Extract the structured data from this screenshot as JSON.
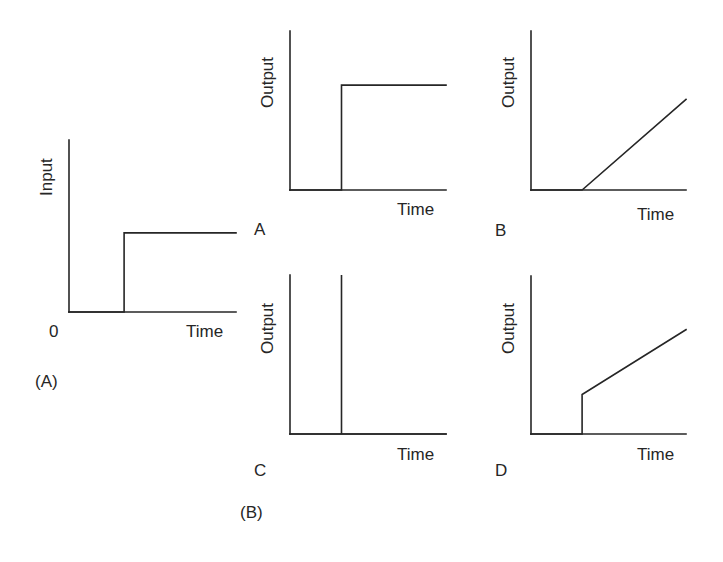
{
  "figure": {
    "part_labels": {
      "input": "(A)",
      "outputs": "(B)"
    },
    "input_plot": {
      "ylabel": "Input",
      "xlabel": "Time",
      "origin_label": "0",
      "signal": "step",
      "curve": [
        [
          0,
          0
        ],
        [
          0.33,
          0
        ],
        [
          0.33,
          0.46
        ],
        [
          1.0,
          0.46
        ]
      ]
    },
    "output_plots": [
      {
        "id": "A",
        "label": "A",
        "ylabel": "Output",
        "xlabel": "Time",
        "response": "step",
        "curve": [
          [
            0,
            0
          ],
          [
            0.33,
            0
          ],
          [
            0.33,
            0.66
          ],
          [
            1.0,
            0.66
          ]
        ]
      },
      {
        "id": "B",
        "label": "B",
        "ylabel": "Output",
        "xlabel": "Time",
        "response": "ramp",
        "curve": [
          [
            0,
            0
          ],
          [
            0.33,
            0
          ],
          [
            1.0,
            0.57
          ]
        ]
      },
      {
        "id": "C",
        "label": "C",
        "ylabel": "Output",
        "xlabel": "Time",
        "response": "impulse",
        "curve": [
          [
            0,
            0
          ],
          [
            0.33,
            0
          ],
          [
            0.33,
            1.0
          ],
          [
            0.33,
            0
          ],
          [
            1.0,
            0
          ]
        ]
      },
      {
        "id": "D",
        "label": "D",
        "ylabel": "Output",
        "xlabel": "Time",
        "response": "step-plus-ramp",
        "curve": [
          [
            0,
            0
          ],
          [
            0.33,
            0
          ],
          [
            0.33,
            0.25
          ],
          [
            1.0,
            0.66
          ]
        ]
      }
    ]
  }
}
